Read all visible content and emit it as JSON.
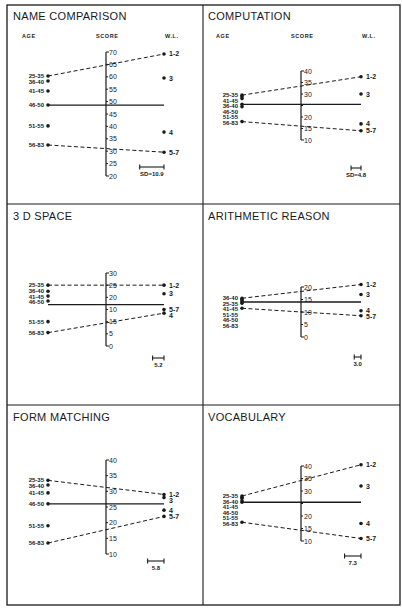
{
  "chart_data": [
    {
      "type": "line",
      "title": "NAME COMPARISON",
      "headers": {
        "age": "AGE",
        "score": "SCORE",
        "wl": "W.L."
      },
      "axis": {
        "min": 20,
        "max": 70,
        "ticks": [
          "70",
          "65",
          "60",
          "55",
          "50",
          "45",
          "40",
          "35",
          "30",
          "25",
          "20"
        ]
      },
      "mean": 48.6,
      "age_groups": [
        {
          "label": "25-35",
          "value": 60.3
        },
        {
          "label": "36-40",
          "value": 58.3
        },
        {
          "label": "41-45",
          "value": 54.3
        },
        {
          "label": "46-50",
          "value": 48.6
        },
        {
          "label": "51-55",
          "value": 40.2
        },
        {
          "label": "56-83",
          "value": 32.5
        }
      ],
      "work_levels": [
        {
          "label": "1-2",
          "value": 69.2
        },
        {
          "label": "3",
          "value": 59.5
        },
        {
          "label": "4",
          "value": 37.7
        },
        {
          "label": "5-7",
          "value": 29.6
        }
      ],
      "dashed_lines": [
        [
          "25-35",
          "1-2"
        ],
        [
          "56-83",
          "5-7"
        ]
      ],
      "sd_label": "SD=10.9",
      "sd": 10.9
    },
    {
      "type": "line",
      "title": "COMPUTATION",
      "headers": {
        "age": "AGE",
        "score": "SCORE",
        "wl": "W.L."
      },
      "axis": {
        "min": 10,
        "max": 40,
        "ticks": [
          "40",
          "35",
          "30",
          "",
          "20",
          "15",
          "10"
        ]
      },
      "mean": 25.5,
      "age_groups": [
        {
          "label": "25-35",
          "value": 29.5
        },
        {
          "label": "41-45",
          "value": 28.8
        },
        {
          "label": "36-40",
          "value": 28.0
        },
        {
          "label": "46-50",
          "value": 25.5
        },
        {
          "label": "51-55",
          "value": 24.5
        },
        {
          "label": "56-83",
          "value": 18.0
        }
      ],
      "work_levels": [
        {
          "label": "1-2",
          "value": 37.5
        },
        {
          "label": "3",
          "value": 30.0
        },
        {
          "label": "4",
          "value": 17.0
        },
        {
          "label": "5-7",
          "value": 14.0
        }
      ],
      "dashed_lines": [
        [
          "25-35",
          "1-2"
        ],
        [
          "56-83",
          "5-7"
        ]
      ],
      "sd_label": "SD=4.8",
      "sd": 4.8
    },
    {
      "type": "line",
      "title": "3 D SPACE",
      "headers": {
        "age": "",
        "score": "",
        "wl": ""
      },
      "axis": {
        "min": 0,
        "max": 30,
        "ticks": [
          "30",
          "25",
          "20",
          "10",
          "15",
          "5",
          "0"
        ]
      },
      "mean": 17.0,
      "age_groups": [
        {
          "label": "25-35",
          "value": 25.0
        },
        {
          "label": "36-40",
          "value": 22.5
        },
        {
          "label": "41-45",
          "value": 20.5
        },
        {
          "label": "46-50",
          "value": 18.5
        },
        {
          "label": "51-55",
          "value": 10.0
        },
        {
          "label": "56-83",
          "value": 5.5
        }
      ],
      "work_levels": [
        {
          "label": "1-2",
          "value": 25.0
        },
        {
          "label": "3",
          "value": 21.5
        },
        {
          "label": "5-7",
          "value": 15.0
        },
        {
          "label": "4",
          "value": 13.5
        }
      ],
      "dashed_lines": [
        [
          "25-35",
          "1-2"
        ],
        [
          "56-83",
          "4"
        ]
      ],
      "sd_label": "5.2",
      "sd": 5.2
    },
    {
      "type": "line",
      "title": "ARITHMETIC REASON",
      "headers": {
        "age": "",
        "score": "",
        "wl": ""
      },
      "axis": {
        "min": 0,
        "max": 20,
        "ticks": [
          "20",
          "15",
          "10",
          "5",
          "0"
        ]
      },
      "mean": 14.0,
      "age_groups": [
        {
          "label": "36-40",
          "value": 15.5
        },
        {
          "label": "25-35",
          "value": 15.0
        },
        {
          "label": "41-45",
          "value": 14.5
        },
        {
          "label": "51-55",
          "value": 14.0
        },
        {
          "label": "46-50",
          "value": 13.5
        },
        {
          "label": "56-83",
          "value": 11.5
        }
      ],
      "work_levels": [
        {
          "label": "1-2",
          "value": 21.0
        },
        {
          "label": "3",
          "value": 17.0
        },
        {
          "label": "4",
          "value": 10.5
        },
        {
          "label": "5-7",
          "value": 8.5
        }
      ],
      "dashed_lines": [
        [
          "36-40",
          "1-2"
        ],
        [
          "56-83",
          "5-7"
        ]
      ],
      "sd_label": "3.0",
      "sd": 3.0
    },
    {
      "type": "line",
      "title": "FORM MATCHING",
      "headers": {
        "age": "",
        "score": "",
        "wl": ""
      },
      "axis": {
        "min": 10,
        "max": 40,
        "ticks": [
          "40",
          "35",
          "30",
          "25",
          "20",
          "15",
          "10"
        ]
      },
      "mean": 26.0,
      "age_groups": [
        {
          "label": "25-35",
          "value": 33.5
        },
        {
          "label": "36-40",
          "value": 32.0
        },
        {
          "label": "41-45",
          "value": 29.5
        },
        {
          "label": "46-50",
          "value": 26.0
        },
        {
          "label": "51-55",
          "value": 19.0
        },
        {
          "label": "56-83",
          "value": 13.5
        }
      ],
      "work_levels": [
        {
          "label": "1-2",
          "value": 29.0
        },
        {
          "label": "3",
          "value": 28.0
        },
        {
          "label": "4",
          "value": 24.0
        },
        {
          "label": "5-7",
          "value": 22.0
        }
      ],
      "dashed_lines": [
        [
          "25-35",
          "1-2"
        ],
        [
          "56-83",
          "5-7"
        ]
      ],
      "sd_label": "5.8",
      "sd": 5.8
    },
    {
      "type": "line",
      "title": "VOCABULARY",
      "headers": {
        "age": "",
        "score": "",
        "wl": ""
      },
      "axis": {
        "min": 10,
        "max": 40,
        "ticks": [
          "40",
          "35",
          "30",
          "",
          "20",
          "15",
          "10"
        ]
      },
      "mean": 25.5,
      "age_groups": [
        {
          "label": "25-35",
          "value": 28.0
        },
        {
          "label": "36-40",
          "value": 27.5
        },
        {
          "label": "41-45",
          "value": 27.0
        },
        {
          "label": "46-50",
          "value": 26.0
        },
        {
          "label": "51-55",
          "value": 25.5
        },
        {
          "label": "56-83",
          "value": 17.5
        }
      ],
      "work_levels": [
        {
          "label": "1-2",
          "value": 40.5
        },
        {
          "label": "3",
          "value": 32.0
        },
        {
          "label": "4",
          "value": 17.0
        },
        {
          "label": "5-7",
          "value": 11.0
        }
      ],
      "dashed_lines": [
        [
          "25-35",
          "1-2"
        ],
        [
          "56-83",
          "5-7"
        ]
      ],
      "sd_label": "7.3",
      "sd": 7.3
    }
  ]
}
